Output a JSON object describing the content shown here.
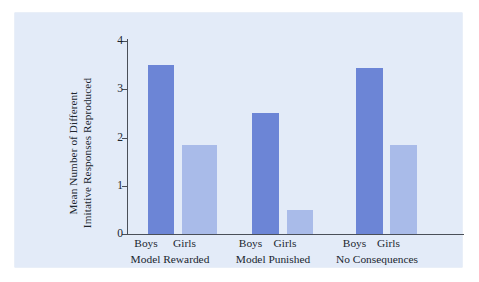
{
  "figure": {
    "background_color": "#e3ebf8",
    "bar_colors": {
      "boys": "#6c85d6",
      "girls": "#a9bbe9"
    },
    "axis_color": "#4a4f58",
    "y_axis_title_line1": "Mean Number of Different",
    "y_axis_title_line2": "Imitative Responses Reproduced"
  },
  "chart_data": {
    "type": "bar",
    "title": "",
    "xlabel": "",
    "ylabel": "Mean Number of Different Imitative Responses Reproduced",
    "ylim": [
      0,
      4
    ],
    "yticks": [
      "0",
      "1",
      "2",
      "3",
      "4"
    ],
    "grid": false,
    "legend": "none",
    "categories": [
      "Model Rewarded",
      "Model Punished",
      "No Consequences"
    ],
    "subcategories": [
      "Boys",
      "Girls"
    ],
    "series": [
      {
        "name": "Boys",
        "values": [
          3.5,
          2.5,
          3.45
        ]
      },
      {
        "name": "Girls",
        "values": [
          1.85,
          0.5,
          1.85
        ]
      }
    ],
    "bars": [
      {
        "group": "Model Rewarded",
        "sub": "Boys",
        "value": 3.5
      },
      {
        "group": "Model Rewarded",
        "sub": "Girls",
        "value": 1.85
      },
      {
        "group": "Model Punished",
        "sub": "Boys",
        "value": 2.5
      },
      {
        "group": "Model Punished",
        "sub": "Girls",
        "value": 0.5
      },
      {
        "group": "No Consequences",
        "sub": "Boys",
        "value": 3.45
      },
      {
        "group": "No Consequences",
        "sub": "Girls",
        "value": 1.85
      }
    ]
  }
}
